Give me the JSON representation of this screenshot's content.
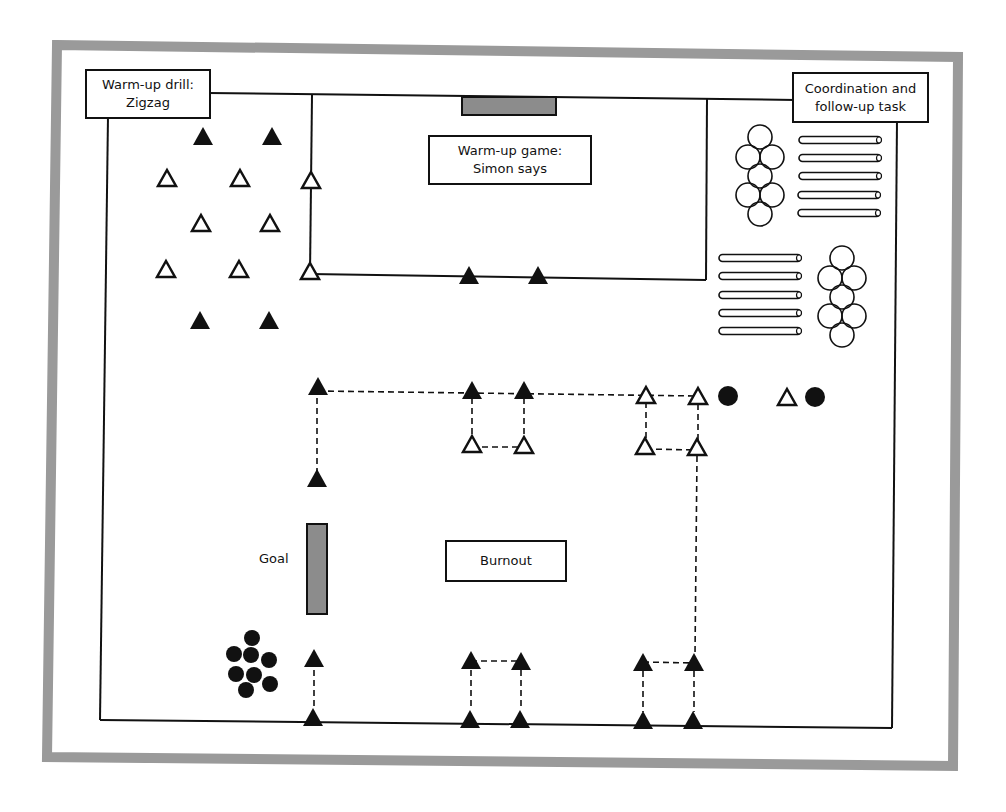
{
  "diagram": {
    "colors": {
      "frame": "#9a9a9a",
      "line": "#111111",
      "goal_fill": "#8c8c8c",
      "background": "#ffffff"
    },
    "labels": {
      "warmup_drill": "Warm-up drill:\nZigzag",
      "warmup_game": "Warm-up game:\nSimon says",
      "coordination": "Coordination and\nfollow-up task",
      "burnout": "Burnout",
      "goal": "Goal"
    },
    "legend_shapes": {
      "filled_triangle": "cone (filled)",
      "open_triangle": "cone (open)",
      "filled_circle": "ball",
      "open_circle": "ring/hoop",
      "bar": "hurdle/pole",
      "grey_rect": "goal"
    }
  }
}
